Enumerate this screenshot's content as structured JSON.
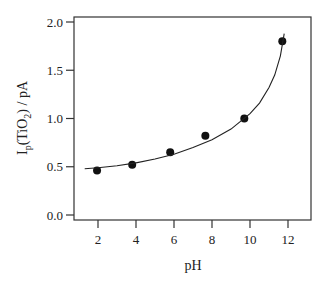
{
  "chart_data": {
    "type": "scatter",
    "title": "",
    "xlabel": "pH",
    "ylabel": "I_p(TiO_2) / pA",
    "ylabel_parts": {
      "main1": "I",
      "sub1": "p",
      "main2": "(TiO",
      "sub2": "2",
      "main3": ") / pA"
    },
    "xlim": [
      0.75,
      13.5
    ],
    "ylim": [
      0.0,
      2.0
    ],
    "xticks": [
      2,
      4,
      6,
      8,
      10,
      12
    ],
    "xtick_labels": [
      "2",
      "4",
      "6",
      "8",
      "10",
      "12"
    ],
    "yticks": [
      0.0,
      0.5,
      1.0,
      1.5,
      2.0
    ],
    "ytick_labels": [
      "0.0",
      "0.5",
      "1.0",
      "1.5",
      "2.0"
    ],
    "grid": false,
    "legend": null,
    "series": [
      {
        "name": "measured",
        "style": "markers",
        "marker_color": "#111111",
        "x": [
          1.95,
          3.8,
          5.8,
          7.65,
          9.7,
          11.7
        ],
        "y": [
          0.46,
          0.52,
          0.65,
          0.82,
          1.0,
          1.8
        ]
      },
      {
        "name": "fit",
        "style": "line",
        "line_color": "#222222",
        "x": [
          1.3,
          2,
          3,
          4,
          5,
          6,
          7,
          8,
          9,
          10,
          10.5,
          11,
          11.3,
          11.6,
          11.8
        ],
        "y": [
          0.48,
          0.49,
          0.51,
          0.54,
          0.58,
          0.63,
          0.7,
          0.78,
          0.89,
          1.05,
          1.16,
          1.32,
          1.45,
          1.65,
          1.88
        ]
      }
    ]
  }
}
